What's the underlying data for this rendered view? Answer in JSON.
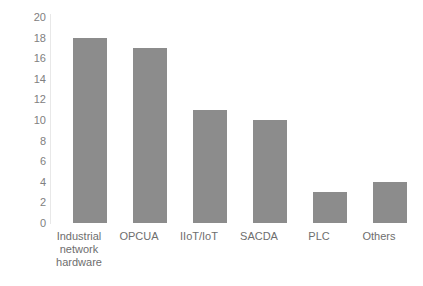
{
  "chart_data": {
    "type": "bar",
    "title": "",
    "subtitle": "",
    "xlabel": "",
    "ylabel": "",
    "categories": [
      "Industrial network hardware",
      "OPCUA",
      "IIoT/IoT",
      "SACDA",
      "PLC",
      "Others"
    ],
    "category_lines": [
      [
        "Industrial",
        "network",
        "hardware"
      ],
      [
        "OPCUA"
      ],
      [
        "IIoT/IoT"
      ],
      [
        "SACDA"
      ],
      [
        "PLC"
      ],
      [
        "Others"
      ]
    ],
    "values": [
      18,
      17,
      11,
      10,
      3,
      4
    ],
    "ylim": [
      0,
      20
    ],
    "ytick_step": 2,
    "yticks": [
      20,
      18,
      16,
      14,
      12,
      10,
      8,
      6,
      4,
      2,
      0
    ],
    "grid": false,
    "legend": false,
    "legend_position": "none",
    "bar_color": "#8c8c8c",
    "axis_line_color": "#e8e8e8",
    "tick_label_color": "#808080",
    "category_label_color": "#6e6e6e",
    "background_color": "#ffffff"
  }
}
